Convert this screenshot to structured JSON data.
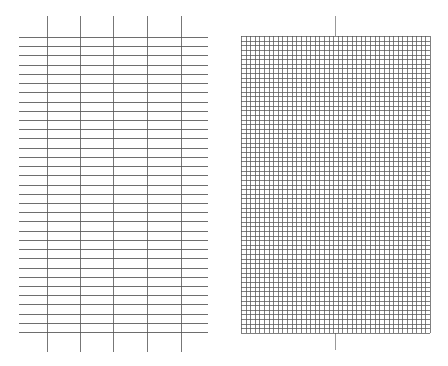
{
  "page": {
    "background": "#ffffff",
    "line_color": "#555555"
  },
  "ruled_sheet": {
    "label": "",
    "vertical_lines_x": [
      47,
      80,
      113,
      147,
      181
    ],
    "vertical_top": 16,
    "vertical_bottom": 352,
    "horizontal_left": 19,
    "horizontal_right": 208,
    "horizontal_first_y": 37,
    "horizontal_spacing": 9.22,
    "horizontal_count": 33
  },
  "graph_sheet": {
    "label": "",
    "left": 241,
    "top": 36,
    "right": 430,
    "bottom": 333,
    "columns": 41,
    "rows": 64,
    "center_line_x": 335,
    "center_line_top": 16,
    "center_line_bottom": 350
  }
}
